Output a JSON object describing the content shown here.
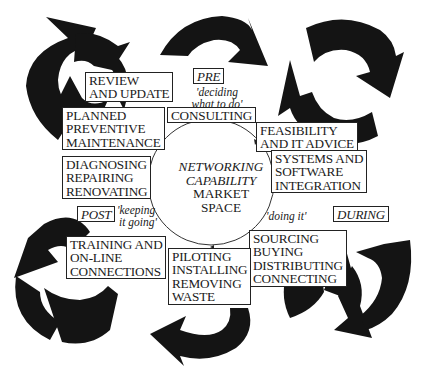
{
  "diagram": {
    "center": {
      "lines_italic": [
        "NETWORKING",
        "CAPABILITY"
      ],
      "lines_plain": [
        "MARKET",
        "SPACE"
      ]
    },
    "phases": {
      "pre": {
        "label": "PRE",
        "note": [
          "'deciding",
          "what to do'"
        ]
      },
      "during": {
        "label": "DURING",
        "note": [
          "'doing it'"
        ]
      },
      "post": {
        "label": "POST",
        "note": [
          "'keeping",
          "it going'"
        ]
      }
    },
    "activities": [
      {
        "id": "consulting",
        "lines": [
          "CONSULTING"
        ]
      },
      {
        "id": "feasibility",
        "lines": [
          "FEASIBILITY",
          "AND IT ADVICE"
        ]
      },
      {
        "id": "systems",
        "lines": [
          "SYSTEMS AND",
          "SOFTWARE",
          "INTEGRATION"
        ]
      },
      {
        "id": "sourcing",
        "lines": [
          "SOURCING",
          "BUYING",
          "DISTRIBUTING",
          "CONNECTING"
        ]
      },
      {
        "id": "piloting",
        "lines": [
          "PILOTING",
          "INSTALLING",
          "REMOVING",
          "WASTE"
        ]
      },
      {
        "id": "training",
        "lines": [
          "TRAINING AND",
          "ON-LINE",
          "CONNECTIONS"
        ]
      },
      {
        "id": "diagnosing",
        "lines": [
          "DIAGNOSING",
          "REPAIRING",
          "RENOVATING"
        ]
      },
      {
        "id": "planned",
        "lines": [
          "PLANNED",
          "PREVENTIVE",
          "MAINTENANCE"
        ]
      },
      {
        "id": "review",
        "lines": [
          "REVIEW",
          "AND UPDATE"
        ]
      }
    ],
    "colors": {
      "arrows": "#141414",
      "text": "#1a1a1a",
      "background": "#ffffff"
    }
  }
}
